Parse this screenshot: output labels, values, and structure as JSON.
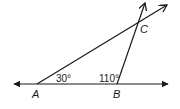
{
  "diagram": {
    "type": "geometry-triangle",
    "colors": {
      "stroke": "#1a1a1a",
      "background": "#ffffff"
    },
    "points": {
      "A": {
        "label": "A",
        "x": 37,
        "y": 84
      },
      "B": {
        "label": "B",
        "x": 117,
        "y": 84
      },
      "C": {
        "label": "C",
        "x": 138,
        "y": 23
      }
    },
    "angles": [
      {
        "vertex": "A",
        "label": "30°"
      },
      {
        "vertex": "B",
        "label": "110°"
      }
    ],
    "lines": [
      {
        "name": "line-AB",
        "description": "horizontal line through A and B, arrows both ends"
      },
      {
        "name": "ray-AC",
        "description": "ray from A through C"
      },
      {
        "name": "ray-BC",
        "description": "ray from B through C"
      }
    ]
  }
}
